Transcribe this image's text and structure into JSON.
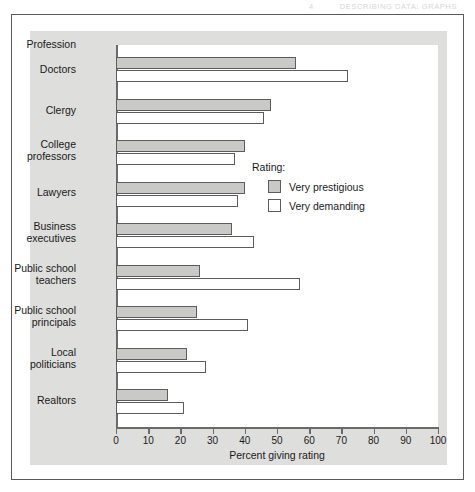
{
  "running_head": {
    "folio": "4",
    "title": "DESCRIBING DATA: GRAPHS"
  },
  "chart_data": {
    "type": "bar",
    "orientation": "horizontal",
    "title": "",
    "xlabel": "Percent giving rating",
    "ylabel": "Profession",
    "xlim": [
      0,
      100
    ],
    "xticks": [
      0,
      10,
      20,
      30,
      40,
      50,
      60,
      70,
      80,
      90,
      100
    ],
    "grid": false,
    "legend_title": "Rating:",
    "legend_position": "inside-right",
    "categories": [
      "Doctors",
      "Clergy",
      "College\nprofessors",
      "Lawyers",
      "Business\nexecutives",
      "Public school\nteachers",
      "Public school\nprincipals",
      "Local\npoliticians",
      "Realtors"
    ],
    "series": [
      {
        "name": "Very prestigious",
        "color": "#c9c9c7",
        "values": [
          56,
          48,
          40,
          40,
          36,
          26,
          25,
          22,
          16
        ]
      },
      {
        "name": "Very demanding",
        "color": "#ffffff",
        "values": [
          72,
          46,
          37,
          38,
          43,
          57,
          41,
          28,
          21
        ]
      }
    ]
  },
  "colors": {
    "panel_background": "#dededd",
    "plot_background": "#ffffff",
    "axis": "#6a6a6a",
    "bar_outline": "#5c5c5c",
    "frame": "#5a5a5a",
    "text": "#1a1a1a"
  }
}
